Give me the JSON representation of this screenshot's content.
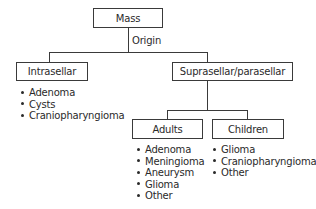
{
  "diagram": {
    "root": {
      "label": "Mass"
    },
    "edge_label": "Origin",
    "intrasellar": {
      "label": "Intrasellar",
      "items": [
        "Adenoma",
        "Cysts",
        "Craniopharyngioma"
      ]
    },
    "suprasellar": {
      "label": "Suprasellar/parasellar",
      "adults": {
        "label": "Adults",
        "items": [
          "Adenoma",
          "Meningioma",
          "Aneurysm",
          "Glioma",
          "Other"
        ]
      },
      "children": {
        "label": "Children",
        "items": [
          "Glioma",
          "Craniopharyngioma",
          "Other"
        ]
      }
    }
  }
}
